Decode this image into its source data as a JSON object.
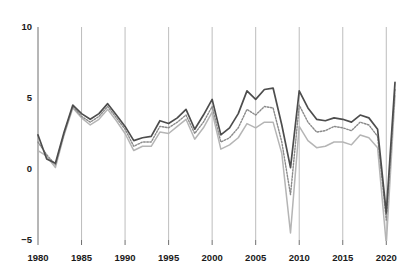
{
  "chart_data": {
    "type": "line",
    "title": "",
    "subtitle": "",
    "xlabel": "",
    "ylabel": "",
    "xlim": [
      1980,
      2021
    ],
    "ylim": [
      -5,
      10
    ],
    "yticks": [
      -5,
      0,
      5,
      10
    ],
    "ytick_labels": [
      "−5",
      "0",
      "5",
      "10"
    ],
    "xticks": [
      1980,
      1985,
      1990,
      1995,
      2000,
      2005,
      2010,
      2015,
      2020
    ],
    "xtick_labels": [
      "1980",
      "1985",
      "1990",
      "1995",
      "2000",
      "2005",
      "2010",
      "2015",
      "2020"
    ],
    "grid": "vertical-only",
    "legend": "none",
    "x": [
      1980,
      1981,
      1982,
      1983,
      1984,
      1985,
      1986,
      1987,
      1988,
      1989,
      1990,
      1991,
      1992,
      1993,
      1994,
      1995,
      1996,
      1997,
      1998,
      1999,
      2000,
      2001,
      2002,
      2003,
      2004,
      2005,
      2006,
      2007,
      2008,
      2009,
      2010,
      2011,
      2012,
      2013,
      2014,
      2015,
      2016,
      2017,
      2018,
      2019,
      2020,
      2021
    ],
    "series": [
      {
        "name": "series-upper-dark",
        "color": "#4d4d4d",
        "style": "solid",
        "width": 1.7,
        "values": [
          2.4,
          0.7,
          0.4,
          2.6,
          4.5,
          3.9,
          3.5,
          3.9,
          4.6,
          3.8,
          3.0,
          2.0,
          2.2,
          2.3,
          3.4,
          3.2,
          3.6,
          4.2,
          2.8,
          3.8,
          4.9,
          2.4,
          2.9,
          3.9,
          5.5,
          4.9,
          5.6,
          5.7,
          3.1,
          0.1,
          5.5,
          4.3,
          3.5,
          3.4,
          3.6,
          3.5,
          3.3,
          3.8,
          3.6,
          2.8,
          -3.1,
          6.1
        ]
      },
      {
        "name": "series-middle-dotted",
        "color": "#8a8a8a",
        "style": "dotted",
        "width": 1.4,
        "values": [
          1.9,
          1.0,
          0.3,
          2.5,
          4.4,
          3.7,
          3.3,
          3.7,
          4.4,
          3.6,
          2.8,
          1.6,
          1.9,
          1.9,
          3.0,
          2.9,
          3.3,
          3.8,
          2.5,
          3.3,
          4.4,
          1.9,
          2.2,
          2.9,
          4.2,
          3.8,
          4.4,
          4.3,
          1.9,
          -1.8,
          4.5,
          3.3,
          2.6,
          2.7,
          3.0,
          2.9,
          2.7,
          3.3,
          3.1,
          2.3,
          -3.6,
          5.6
        ]
      },
      {
        "name": "series-lower-light",
        "color": "#b5b5b5",
        "style": "solid",
        "width": 1.5,
        "values": [
          1.3,
          0.9,
          0.1,
          2.4,
          4.3,
          3.6,
          3.1,
          3.5,
          4.2,
          3.4,
          2.5,
          1.3,
          1.6,
          1.6,
          2.6,
          2.5,
          3.0,
          3.5,
          2.1,
          2.9,
          4.0,
          1.4,
          1.7,
          2.2,
          3.2,
          2.9,
          3.3,
          3.3,
          1.1,
          -4.5,
          3.0,
          2.0,
          1.5,
          1.6,
          1.9,
          1.9,
          1.7,
          2.4,
          2.2,
          1.5,
          -5.3,
          5.2
        ]
      }
    ]
  },
  "plot_geometry": {
    "left": 38,
    "right": 395,
    "top": 27,
    "bottom": 240
  }
}
